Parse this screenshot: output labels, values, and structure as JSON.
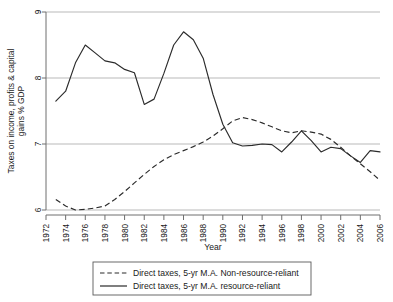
{
  "chart_data": {
    "type": "line",
    "title": "",
    "xlabel": "Year",
    "ylabel": "Taxes on income, profits & capital gains % GDP",
    "xlim": [
      1972,
      2006
    ],
    "ylim": [
      6,
      9
    ],
    "yticks": [
      6,
      7,
      8,
      9
    ],
    "ytick_labels": [
      "6",
      "7",
      "8",
      "9"
    ],
    "xticks": [
      1972,
      1974,
      1976,
      1978,
      1980,
      1982,
      1984,
      1986,
      1988,
      1990,
      1992,
      1994,
      1996,
      1998,
      2000,
      2002,
      2004,
      2006
    ],
    "xtick_labels": [
      "1972",
      "1974",
      "1976",
      "1978",
      "1980",
      "1982",
      "1984",
      "1986",
      "1988",
      "1990",
      "1992",
      "1994",
      "1996",
      "1998",
      "2000",
      "2002",
      "2004",
      "2006"
    ],
    "grid": true,
    "grid_axis": "y",
    "legend_position": "below",
    "series": [
      {
        "name": "Direct taxes, 5-yr M.A. Non-resource-reliant",
        "style": "dashed",
        "color": "#2b2b2b",
        "x": [
          1973,
          1974,
          1975,
          1976,
          1977,
          1978,
          1979,
          1980,
          1981,
          1982,
          1983,
          1984,
          1985,
          1986,
          1987,
          1988,
          1989,
          1990,
          1991,
          1992,
          1993,
          1994,
          1995,
          1996,
          1997,
          1998,
          1999,
          2000,
          2001,
          2002,
          2003,
          2004,
          2005,
          2006
        ],
        "values": [
          6.16,
          6.06,
          6.0,
          6.01,
          6.03,
          6.06,
          6.16,
          6.28,
          6.41,
          6.54,
          6.66,
          6.76,
          6.84,
          6.9,
          6.96,
          7.03,
          7.12,
          7.23,
          7.35,
          7.4,
          7.37,
          7.32,
          7.26,
          7.2,
          7.17,
          7.2,
          7.18,
          7.15,
          7.07,
          6.95,
          6.82,
          6.7,
          6.58,
          6.45
        ]
      },
      {
        "name": "Direct taxes, 5-yr M.A. resource-reliant",
        "style": "solid",
        "color": "#2b2b2b",
        "x": [
          1973,
          1974,
          1975,
          1976,
          1977,
          1978,
          1979,
          1980,
          1981,
          1982,
          1983,
          1984,
          1985,
          1986,
          1987,
          1988,
          1989,
          1990,
          1991,
          1992,
          1993,
          1994,
          1995,
          1996,
          1997,
          1998,
          1999,
          2000,
          2001,
          2002,
          2003,
          2004,
          2005,
          2006
        ],
        "values": [
          7.65,
          7.8,
          8.23,
          8.5,
          8.38,
          8.26,
          8.23,
          8.13,
          8.08,
          7.6,
          7.68,
          8.07,
          8.5,
          8.7,
          8.58,
          8.3,
          7.75,
          7.3,
          7.02,
          6.97,
          6.98,
          7.0,
          6.99,
          6.88,
          7.03,
          7.2,
          7.05,
          6.88,
          6.95,
          6.93,
          6.82,
          6.72,
          6.9,
          6.88
        ]
      }
    ]
  },
  "legend": {
    "entries": [
      {
        "label": "Direct taxes, 5-yr M.A. Non-resource-reliant",
        "style": "dashed"
      },
      {
        "label": "Direct taxes, 5-yr M.A. resource-reliant",
        "style": "solid"
      }
    ]
  }
}
